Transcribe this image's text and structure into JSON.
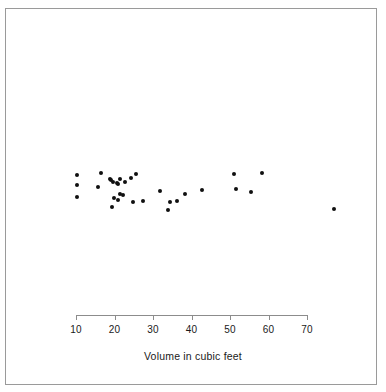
{
  "chart_data": {
    "type": "scatter",
    "title": "",
    "subtitle": "",
    "xlabel": "Volume in cubic feet",
    "ylabel": "",
    "xlim": [
      6,
      80
    ],
    "ylim": [
      0,
      1
    ],
    "grid": false,
    "legend": null,
    "axis_ticks": [
      10,
      20,
      30,
      40,
      50,
      60,
      70
    ],
    "tick_labels": [
      "10",
      "20",
      "30",
      "40",
      "50",
      "60",
      "70"
    ],
    "series": [
      {
        "name": "Volume",
        "marker": "filled-circle",
        "color": "#101010",
        "points": [
          {
            "x": 10.3,
            "y": 0.78
          },
          {
            "x": 10.3,
            "y": 0.6
          },
          {
            "x": 10.2,
            "y": 0.4
          },
          {
            "x": 15.6,
            "y": 0.58
          },
          {
            "x": 16.4,
            "y": 0.82
          },
          {
            "x": 18.8,
            "y": 0.72
          },
          {
            "x": 19.1,
            "y": 0.7
          },
          {
            "x": 19.7,
            "y": 0.66
          },
          {
            "x": 20.6,
            "y": 0.64
          },
          {
            "x": 21.0,
            "y": 0.62
          },
          {
            "x": 21.3,
            "y": 0.72
          },
          {
            "x": 19.9,
            "y": 0.38
          },
          {
            "x": 20.8,
            "y": 0.34
          },
          {
            "x": 21.4,
            "y": 0.45
          },
          {
            "x": 22.2,
            "y": 0.42
          },
          {
            "x": 22.6,
            "y": 0.66
          },
          {
            "x": 24.2,
            "y": 0.74
          },
          {
            "x": 25.7,
            "y": 0.8
          },
          {
            "x": 19.4,
            "y": 0.22
          },
          {
            "x": 24.9,
            "y": 0.3
          },
          {
            "x": 27.4,
            "y": 0.32
          },
          {
            "x": 31.7,
            "y": 0.5
          },
          {
            "x": 33.8,
            "y": 0.16
          },
          {
            "x": 34.5,
            "y": 0.3
          },
          {
            "x": 36.3,
            "y": 0.32
          },
          {
            "x": 38.3,
            "y": 0.44
          },
          {
            "x": 42.6,
            "y": 0.52
          },
          {
            "x": 51.0,
            "y": 0.8
          },
          {
            "x": 51.5,
            "y": 0.54
          },
          {
            "x": 55.4,
            "y": 0.48
          },
          {
            "x": 58.3,
            "y": 0.82
          },
          {
            "x": 77.0,
            "y": 0.18
          }
        ]
      }
    ]
  },
  "axis": {
    "title": "Volume in cubic feet"
  }
}
